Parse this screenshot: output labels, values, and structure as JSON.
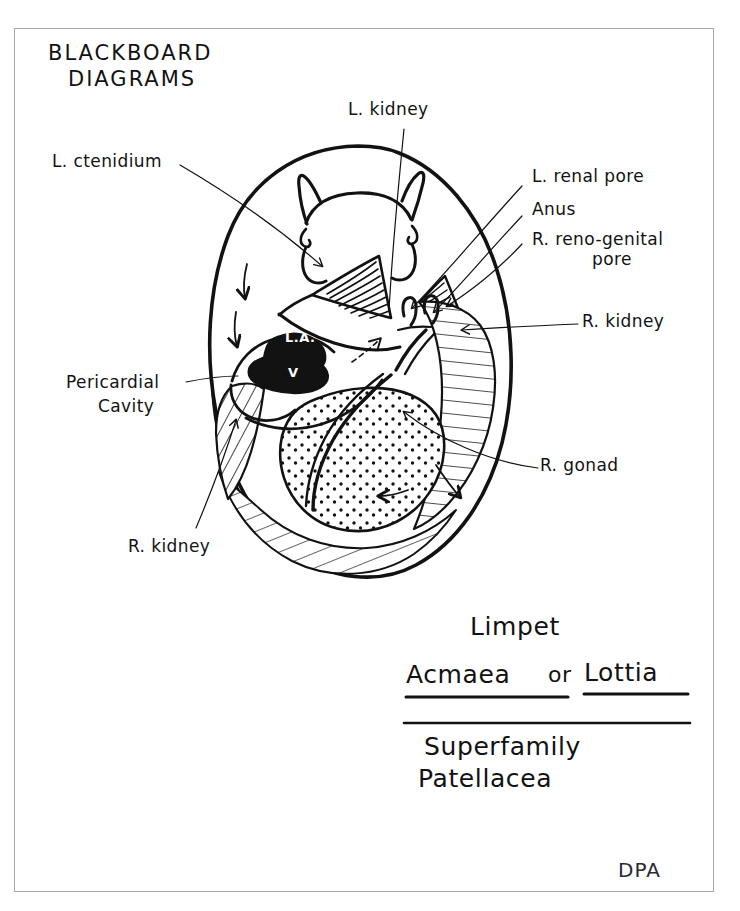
{
  "page": {
    "title_lines": [
      "BLACKBOARD",
      "DIAGRAMS"
    ],
    "signature": "DPA"
  },
  "labels": {
    "l_kidney_top": "L. kidney",
    "l_ctenidium": "L. ctenidium",
    "l_renal_pore": "L. renal pore",
    "anus": "Anus",
    "r_reno_genital_pore_line1": "R. reno-genital",
    "r_reno_genital_pore_line2": "pore",
    "r_kidney_right": "R. kidney",
    "r_gonad": "R. gonad",
    "pericardial_cavity_line1": "Pericardial",
    "pericardial_cavity_line2": "Cavity",
    "r_kidney_bottom": "R. kidney"
  },
  "heart": {
    "left_auricle": "L.A.",
    "ventricle": "V"
  },
  "caption": {
    "common_name": "Limpet",
    "genus_a": "Acmaea",
    "conjunction": "or",
    "genus_b": "Lottia",
    "rank": "Superfamily",
    "taxon": "Patellacea"
  },
  "colors": {
    "ink": "#121212",
    "frame": "#a8a8a8",
    "paper": "#ffffff"
  }
}
